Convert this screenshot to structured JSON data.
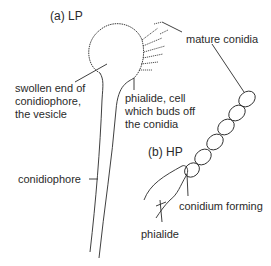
{
  "diagram": {
    "parts": [
      {
        "id": "a",
        "label": "(a)  LP"
      },
      {
        "id": "b",
        "label": "(b)  HP"
      }
    ],
    "labels": {
      "mature_conidia": "mature conidia",
      "vesicle": [
        "swollen end of",
        "conidiophore,",
        "the vesicle"
      ],
      "phialide_cell": [
        "phialide, cell",
        "which buds off",
        "the conidia"
      ],
      "conidiophore": "conidiophore",
      "conidium_forming": "conidium forming",
      "phialide": "phialide"
    },
    "colors": {
      "ink": "#2a2a2a",
      "background": "#ffffff"
    }
  }
}
